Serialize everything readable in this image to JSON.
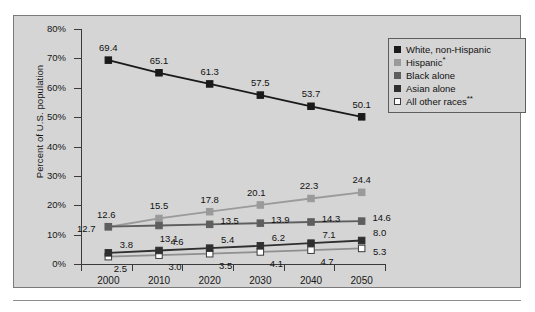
{
  "chart_data": {
    "type": "line",
    "title": "",
    "xlabel": "",
    "ylabel": "Percent of U.S. population",
    "categories": [
      "2000",
      "2010",
      "2020",
      "2030",
      "2040",
      "2050"
    ],
    "ylim": [
      0,
      80
    ],
    "ytick_labels": [
      "0%",
      "10%",
      "20%",
      "30%",
      "40%",
      "50%",
      "60%",
      "70%",
      "80%"
    ],
    "ytick_values": [
      0,
      10,
      20,
      30,
      40,
      50,
      60,
      70,
      80
    ],
    "grid": false,
    "legend_position": "top-right",
    "series": [
      {
        "name": "White, non-Hispanic",
        "legend_label": "White, non-Hispanic",
        "color": "#1a1a1a",
        "marker_fill": "#1a1a1a",
        "values": [
          69.4,
          65.1,
          61.3,
          57.5,
          53.7,
          50.1
        ],
        "labels": [
          "69.4",
          "65.1",
          "61.3",
          "57.5",
          "53.7",
          "50.1"
        ],
        "label_offsets": [
          [
            0,
            -13
          ],
          [
            0,
            -13
          ],
          [
            0,
            -13
          ],
          [
            0,
            -13
          ],
          [
            0,
            -13
          ],
          [
            0,
            -13
          ]
        ]
      },
      {
        "name": "Hispanic",
        "legend_label": "Hispanic",
        "legend_sup": "*",
        "color": "#9a9a9a",
        "marker_fill": "#9a9a9a",
        "values": [
          12.6,
          15.5,
          17.8,
          20.1,
          22.3,
          24.4
        ],
        "labels": [
          "12.6",
          "15.5",
          "17.8",
          "20.1",
          "22.3",
          "24.4"
        ],
        "label_offsets": [
          [
            -2,
            -13
          ],
          [
            0,
            -13
          ],
          [
            0,
            -13
          ],
          [
            -4,
            -13
          ],
          [
            -2,
            -13
          ],
          [
            0,
            -13
          ]
        ]
      },
      {
        "name": "Black alone",
        "legend_label": "Black alone",
        "color": "#5e5e5e",
        "marker_fill": "#5e5e5e",
        "values": [
          12.7,
          13.1,
          13.5,
          13.9,
          14.3,
          14.6
        ],
        "labels": [
          "12.7",
          "13.1",
          "13.5",
          "13.9",
          "14.3",
          "14.6"
        ],
        "label_offsets": [
          [
            -22,
            1
          ],
          [
            10,
            12
          ],
          [
            20,
            -4
          ],
          [
            20,
            -4
          ],
          [
            20,
            -4
          ],
          [
            20,
            -4
          ]
        ]
      },
      {
        "name": "Asian alone",
        "legend_label": "Asian alone",
        "color": "#2f2f2f",
        "marker_fill": "#2f2f2f",
        "values": [
          3.8,
          4.6,
          5.4,
          6.2,
          7.1,
          8.0
        ],
        "labels": [
          "3.8",
          "4.6",
          "5.4",
          "6.2",
          "7.1",
          "8.0"
        ],
        "label_offsets": [
          [
            18,
            -9
          ],
          [
            18,
            -9
          ],
          [
            18,
            -9
          ],
          [
            18,
            -9
          ],
          [
            18,
            -9
          ],
          [
            18,
            -9
          ]
        ]
      },
      {
        "name": "All other races",
        "legend_label": "All other races",
        "legend_sup": "**",
        "color": "#8f8f8f",
        "marker_fill": "#ffffff",
        "values": [
          2.5,
          3.0,
          3.5,
          4.1,
          4.7,
          5.3
        ],
        "labels": [
          "2.5",
          "3.0",
          "3.5",
          "4.1",
          "4.7",
          "5.3"
        ],
        "label_offsets": [
          [
            12,
            11
          ],
          [
            16,
            11
          ],
          [
            16,
            11
          ],
          [
            16,
            11
          ],
          [
            16,
            11
          ],
          [
            18,
            3
          ]
        ]
      }
    ]
  },
  "colors": {
    "panel_background": "#d5d5d5",
    "panel_border": "#7a7a7a",
    "axis": "#3a3a3a",
    "text": "#111111"
  }
}
